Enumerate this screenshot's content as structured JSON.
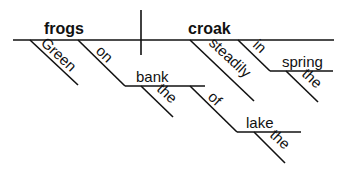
{
  "diagram": {
    "type": "sentence-diagram",
    "sentence": "Green frogs on the bank of the lake croak steadily in the spring",
    "subject": "frogs",
    "verb": "croak",
    "modifiers": {
      "green": "Green",
      "on": "on",
      "bank": "bank",
      "the_bank": "the",
      "of": "of",
      "lake": "lake",
      "the_lake": "the",
      "steadily": "steadily",
      "in": "in",
      "spring": "spring",
      "the_spring": "the"
    }
  }
}
